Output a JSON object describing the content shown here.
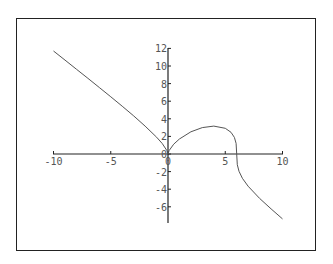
{
  "chart_data": {
    "type": "line",
    "title": "",
    "xlabel": "",
    "ylabel": "",
    "function": "y = (6x^2 - x^3)^(1/3)",
    "xlim": [
      -10,
      10
    ],
    "ylim": [
      -7.4,
      12
    ],
    "grid": false,
    "legend": null,
    "x_ticks": [
      -10,
      -5,
      0,
      5,
      10
    ],
    "x_tick_labels": [
      "-10",
      "-5",
      "0",
      "5",
      "10"
    ],
    "y_ticks": [
      12,
      10,
      8,
      6,
      4,
      2,
      0,
      -2,
      -4,
      -6
    ],
    "y_tick_labels": [
      "12",
      "10",
      "8",
      "6",
      "4",
      "2",
      "0",
      "-2",
      "-4",
      "-6"
    ],
    "series": [
      {
        "name": "curve",
        "color": "#555555",
        "x": [
          -10,
          -9,
          -8,
          -7,
          -6,
          -5,
          -4,
          -3,
          -2,
          -1,
          -0.5,
          -0.1,
          0,
          0.1,
          0.5,
          1,
          2,
          3,
          4,
          5,
          5.5,
          5.8,
          5.95,
          6,
          6.05,
          6.2,
          6.5,
          7,
          8,
          9,
          10
        ],
        "y": [
          11.7,
          10.67,
          9.64,
          8.6,
          7.56,
          6.5,
          5.43,
          4.33,
          3.17,
          1.91,
          1.18,
          0.39,
          0,
          0.39,
          1.11,
          1.71,
          2.52,
          3.0,
          3.17,
          2.92,
          2.47,
          1.89,
          1.21,
          0,
          -1.22,
          -1.97,
          -2.76,
          -3.66,
          -5.04,
          -6.24,
          -7.37
        ]
      }
    ]
  },
  "axes": {
    "color": "#222222",
    "origin_px": [
      168,
      154
    ],
    "px_per_x": 11.45,
    "px_per_y": 8.8,
    "x_axis_px": [
      53,
      283
    ],
    "y_axis_px": [
      48,
      223
    ]
  }
}
